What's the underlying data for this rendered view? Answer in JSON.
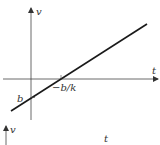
{
  "diagram": {
    "title": "",
    "top_graph": {
      "y_axis_label": "v",
      "x_axis_label": "t",
      "intercept_label": "b",
      "root_label": "−b/k",
      "line": {
        "description": "straight line v = kt + b with positive slope",
        "slope_sign": "positive"
      },
      "colors": {
        "axis": "#444444",
        "line": "#1a1a1a"
      }
    },
    "bottom_graph": {
      "y_axis_label": "v",
      "x_axis_label": "t"
    }
  }
}
